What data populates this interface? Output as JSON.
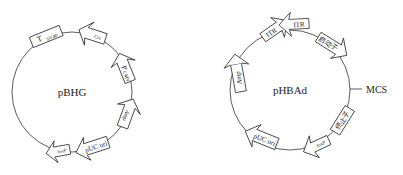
{
  "plasmids": [
    {
      "name": "pBHG",
      "features": [
        {
          "label": "T",
          "sub": "SV40",
          "type": "box"
        },
        {
          "label": "Cre",
          "type": "arrow"
        },
        {
          "label": "P",
          "sub": "CMV",
          "type": "arrow"
        },
        {
          "label": "Amp",
          "sup": "r",
          "type": "arrow"
        },
        {
          "label": "pUC ori",
          "type": "arrow"
        },
        {
          "label": "loxP",
          "type": "arrow"
        }
      ]
    },
    {
      "name": "pHBAd",
      "site_label": "MCS",
      "features": [
        {
          "label": "ITR",
          "type": "arrow"
        },
        {
          "label": "ITR",
          "type": "arrow"
        },
        {
          "label": "启动子",
          "type": "arrow"
        },
        {
          "label": "终止子",
          "type": "box"
        },
        {
          "label": "loxP",
          "type": "arrow"
        },
        {
          "label": "pUC ori",
          "type": "arrow"
        },
        {
          "label": "Amp",
          "sup": "r",
          "type": "arrow"
        }
      ]
    }
  ]
}
